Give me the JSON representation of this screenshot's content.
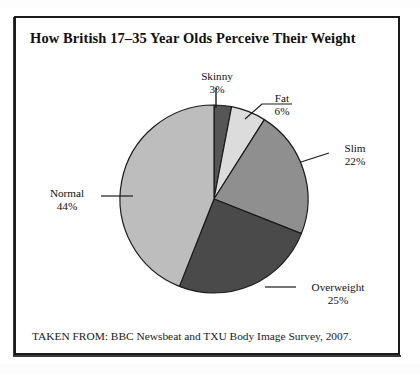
{
  "figure": {
    "title": "How British 17–35 Year Olds Perceive Their Weight",
    "caption": "TAKEN FROM: BBC Newsbeat and TXU Body Image Survey, 2007."
  },
  "labels": {
    "skinny": {
      "name": "Skinny",
      "pct": "3%"
    },
    "fat": {
      "name": "Fat",
      "pct": "6%"
    },
    "slim": {
      "name": "Slim",
      "pct": "22%"
    },
    "overweight": {
      "name": "Overweight",
      "pct": "25%"
    },
    "normal": {
      "name": "Normal",
      "pct": "44%"
    }
  },
  "chart_data": {
    "type": "pie",
    "title": "How British 17–35 Year Olds Perceive Their Weight",
    "subtitle": "",
    "xlabel": "",
    "ylabel": "",
    "categories": [
      "Skinny",
      "Fat",
      "Slim",
      "Overweight",
      "Normal"
    ],
    "values": [
      3,
      6,
      22,
      25,
      44
    ],
    "value_unit": "percent",
    "value_labels": [
      "3%",
      "6%",
      "22%",
      "25%",
      "44%"
    ],
    "total": 100,
    "start_angle_deg": 0,
    "direction": "clockwise",
    "legend": "none",
    "grid": false,
    "labels_position": "outside-with-leader-lines",
    "slice_colors": [
      "#565656",
      "#dcdcdc",
      "#8f8f8f",
      "#4a4a4a",
      "#bdbdbd"
    ],
    "slice_outline_color": "#1b1b1b",
    "annotations": [
      "TAKEN FROM: BBC Newsbeat and TXU Body Image Survey, 2007."
    ]
  },
  "style": {
    "background": "#ffffff",
    "frame_color": "#1b1b1b",
    "text_color": "#111111"
  }
}
